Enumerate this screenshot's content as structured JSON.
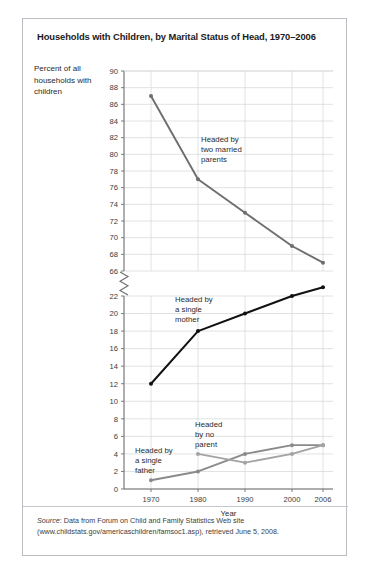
{
  "figure": {
    "title": "Households with Children, by Marital Status of Head, 1970–2006",
    "y_axis_caption": "Percent of all households with children",
    "source_label": "Source",
    "source_text": ": Data from Forum on Child and Family Statistics Web site (www.childstats.gov/americaschildren/famsoc1.asp), retrieved June 5, 2008."
  },
  "chart_data": {
    "type": "line",
    "title": "Households with Children, by Marital Status of Head, 1970–2006",
    "xlabel": "Year",
    "ylabel": "Percent of all households with children",
    "categories": [
      1970,
      1980,
      1990,
      2000,
      2006
    ],
    "xtick_labels": [
      "1970",
      "1980",
      "1990",
      "2000",
      "2006"
    ],
    "grid": true,
    "legend": "inline-annotations",
    "axis_break": {
      "present": true,
      "between": [
        22,
        66
      ],
      "note": "broken y-axis"
    },
    "y_upper_ticks": [
      66,
      68,
      70,
      72,
      74,
      76,
      78,
      80,
      82,
      84,
      86,
      88,
      90
    ],
    "y_lower_ticks": [
      0,
      2,
      4,
      6,
      8,
      10,
      12,
      14,
      16,
      18,
      20,
      22
    ],
    "ylim_upper": [
      66,
      90
    ],
    "ylim_lower": [
      0,
      22
    ],
    "series": [
      {
        "name": "Headed by two married parents",
        "color": "#6e6e6e",
        "annotation": "Headed by\ntwo married\nparents",
        "x": [
          1970,
          1980,
          1990,
          2000,
          2006
        ],
        "values": [
          87,
          77,
          73,
          69,
          67
        ]
      },
      {
        "name": "Headed by a single mother",
        "color": "#111111",
        "annotation": "Headed by\na single\nmother",
        "x": [
          1970,
          1980,
          1990,
          2000,
          2006
        ],
        "values": [
          12,
          18,
          20,
          22,
          23
        ]
      },
      {
        "name": "Headed by a single father",
        "color": "#8a8a8a",
        "annotation": "Headed by\na single\nfather",
        "x": [
          1970,
          1980,
          1990,
          2000,
          2006
        ],
        "values": [
          1,
          2,
          4,
          5,
          5
        ]
      },
      {
        "name": "Headed by no parent",
        "color": "#a3a3a3",
        "annotation": "Headed\nby no\nparent",
        "x": [
          1980,
          1990,
          2000,
          2006
        ],
        "values": [
          4,
          3,
          4,
          5
        ]
      }
    ],
    "annotations": [
      {
        "text_lines": [
          "Headed by",
          "two married",
          "parents"
        ],
        "x": 178,
        "y": 123
      },
      {
        "text_lines": [
          "Headed by",
          "a single",
          "mother"
        ],
        "x": 152,
        "y": 283
      },
      {
        "text_lines": [
          "Headed",
          "by no",
          "parent"
        ],
        "x": 172,
        "y": 408
      },
      {
        "text_lines": [
          "Headed by",
          "a single",
          "father"
        ],
        "x": 112,
        "y": 434
      }
    ]
  }
}
